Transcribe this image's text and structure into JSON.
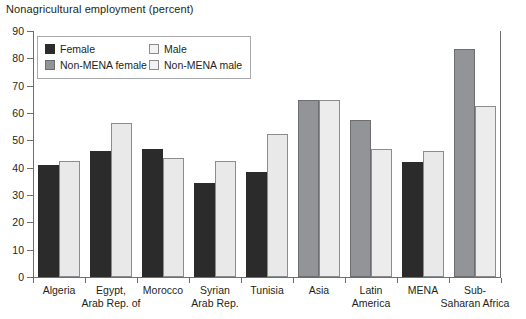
{
  "chart_data": {
    "type": "bar",
    "title": "Nonagricultural employment (percent)",
    "xlabel": "",
    "ylabel": "",
    "ylim": [
      0,
      90
    ],
    "yticks": [
      0,
      10,
      20,
      30,
      40,
      50,
      60,
      70,
      80,
      90
    ],
    "grid": false,
    "legend_position": "top-left-inside",
    "categories": [
      "Algeria",
      "Egypt, Arab Rep. of",
      "Morocco",
      "Syrian Arab Rep.",
      "Tunisia",
      "Asia",
      "Latin America",
      "MENA",
      "Sub-Saharan Africa"
    ],
    "category_lines": [
      [
        "Algeria"
      ],
      [
        "Egypt,",
        "Arab Rep. of"
      ],
      [
        "Morocco"
      ],
      [
        "Syrian",
        "Arab Rep."
      ],
      [
        "Tunisia"
      ],
      [
        "Asia"
      ],
      [
        "Latin",
        "America"
      ],
      [
        "MENA"
      ],
      [
        "Sub-",
        "Saharan Africa"
      ]
    ],
    "series": [
      {
        "name": "Female",
        "key": "female",
        "color": "#2b2b2b",
        "values": [
          41,
          46,
          47,
          34.5,
          38.5,
          null,
          null,
          42,
          null
        ]
      },
      {
        "name": "Male",
        "key": "male",
        "color": "#e9e9e9",
        "values": [
          42.5,
          56.5,
          43.5,
          42.5,
          52.5,
          null,
          null,
          46,
          null
        ]
      },
      {
        "name": "Non-MENA female",
        "key": "nmfemale",
        "color": "#929497",
        "values": [
          null,
          null,
          null,
          null,
          null,
          64.8,
          57.5,
          null,
          83.5
        ]
      },
      {
        "name": "Non-MENA male",
        "key": "nmmale",
        "color": "#ececed",
        "values": [
          null,
          null,
          null,
          null,
          null,
          64.8,
          47,
          null,
          62.5
        ]
      }
    ]
  },
  "legend": {
    "items": [
      {
        "label": "Female",
        "key": "female"
      },
      {
        "label": "Male",
        "key": "male"
      },
      {
        "label": "Non-MENA female",
        "key": "nmfemale"
      },
      {
        "label": "Non-MENA male",
        "key": "nmmale"
      }
    ]
  },
  "colors": {
    "female": "#2b2b2b",
    "male": "#e9e9e9",
    "non_mena_female": "#929497",
    "non_mena_male": "#ececed",
    "axis": "#6d6e71",
    "text": "#231f20"
  }
}
